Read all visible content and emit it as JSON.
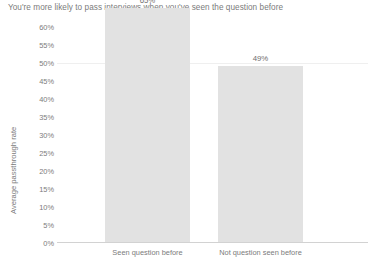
{
  "chart_data": {
    "type": "bar",
    "title": "You're more likely to pass interviews when you've seen the question before",
    "xlabel": "",
    "ylabel": "Average passthrough rate",
    "categories": [
      "Seen question before",
      "Not question seen before"
    ],
    "values": [
      65,
      49
    ],
    "value_labels": [
      "65%",
      "49%"
    ],
    "ylim": [
      0,
      60
    ],
    "ytick_values": [
      0,
      5,
      10,
      15,
      20,
      25,
      30,
      35,
      40,
      45,
      50,
      55,
      60
    ],
    "ytick_labels": [
      "0%",
      "5%",
      "10%",
      "15%",
      "20%",
      "25%",
      "30%",
      "35%",
      "40%",
      "45%",
      "50%",
      "55%",
      "60%"
    ],
    "grid": "faint-horizontal-at-50",
    "legend": "none",
    "bar_color": "#e2e2e2",
    "text_color": "#7b7b7b",
    "axis_color": "#d2d2d2"
  }
}
